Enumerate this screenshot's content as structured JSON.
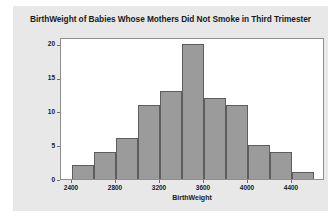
{
  "chart_data": {
    "type": "bar",
    "title": "BirthWeight of Babies Whose Mothers Did Not Smoke in Third Trimester",
    "xlabel": "BirthWeight",
    "ylabel": "Frequency",
    "categories": [
      "2400-2600",
      "2600-2800",
      "2800-3000",
      "3000-3200",
      "3200-3400",
      "3400-3600",
      "3600-3800",
      "3800-4000",
      "4000-4200",
      "4200-4400",
      "4400-4600"
    ],
    "bin_starts": [
      2400,
      2600,
      2800,
      3000,
      3200,
      3400,
      3600,
      3800,
      4000,
      4200,
      4400
    ],
    "bin_width": 200,
    "values": [
      2,
      4,
      6,
      11,
      13,
      20,
      12,
      11,
      5,
      4,
      1
    ],
    "xlim": [
      2300,
      4700
    ],
    "ylim": [
      0,
      21
    ],
    "x_ticks": [
      2400,
      2800,
      3200,
      3600,
      4000,
      4400
    ],
    "x_tick_labels": [
      "2400",
      "2800",
      "3200",
      "3600",
      "4000",
      "4400"
    ],
    "y_ticks": [
      0,
      5,
      10,
      15,
      20
    ],
    "y_tick_labels": [
      "0",
      "5",
      "10",
      "15",
      "20"
    ],
    "grid": false,
    "legend": false,
    "bar_fill_color": "#9b9b9b",
    "bar_edge_color": "#5d5d5d",
    "figure_background": "#e8e8e8",
    "plot_background": "#ffffff"
  }
}
